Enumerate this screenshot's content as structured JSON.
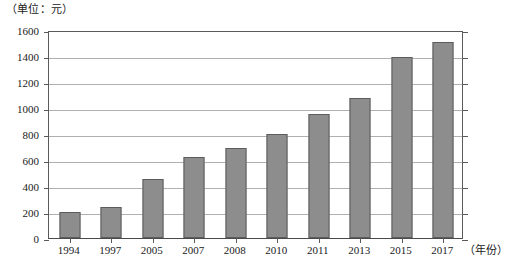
{
  "chart_data": {
    "type": "bar",
    "title": "",
    "unit_label": "（单位：元）",
    "xlabel": "（年份）",
    "ylabel": "",
    "categories": [
      "1994",
      "1997",
      "2005",
      "2007",
      "2008",
      "2010",
      "2011",
      "2013",
      "2015",
      "2017"
    ],
    "values": [
      200,
      240,
      455,
      625,
      695,
      800,
      955,
      1080,
      1390,
      1505
    ],
    "ylim": [
      0,
      1600
    ],
    "ytick_labels": [
      "0",
      "200",
      "400",
      "600",
      "800",
      "1000",
      "1200",
      "1400",
      "1600"
    ],
    "ytick_values": [
      0,
      200,
      400,
      600,
      800,
      1000,
      1200,
      1400,
      1600
    ],
    "grid": true,
    "legend": "none",
    "series": [
      {
        "name": "",
        "values": [
          200,
          240,
          455,
          625,
          695,
          800,
          955,
          1080,
          1390,
          1505
        ]
      }
    ],
    "colors": {
      "bar_fill": "#8d8d8d",
      "bar_border": "#5c5c5c",
      "gridline": "#b0b0b0",
      "axis": "#5a5a5a",
      "background": "#ffffff",
      "text": "#1a1a1a"
    }
  }
}
